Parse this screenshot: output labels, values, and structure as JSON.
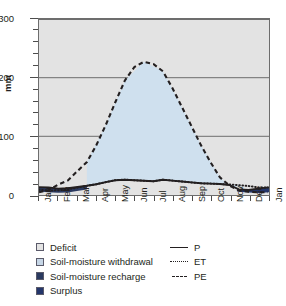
{
  "chart_data": {
    "type": "line",
    "title": "",
    "xlabel": "",
    "ylabel": "mm",
    "ylim": [
      0,
      300
    ],
    "yticks": [
      0,
      100,
      200,
      300
    ],
    "ytick_labels": [
      "0",
      "100",
      "200",
      "300"
    ],
    "y_minor_step": 20,
    "grid": "horizontal-gridlines-at-100-200-300",
    "legend_position": "below-plot",
    "categories": [
      "Jan",
      "Feb",
      "Mar",
      "Apr",
      "May",
      "Jun",
      "Jul",
      "Aug",
      "Sep",
      "Oct",
      "Nov",
      "Dec",
      "Jan"
    ],
    "series": [
      {
        "name": "P",
        "label": "P",
        "style": "solid",
        "color": "#231f20",
        "values": [
          16,
          14,
          15,
          20,
          26,
          22,
          24,
          26,
          23,
          20,
          18,
          17,
          16
        ]
      },
      {
        "name": "ET",
        "label": "ET",
        "style": "dotted",
        "color": "#231f20",
        "values": [
          16,
          14,
          15,
          20,
          26,
          22,
          20,
          17,
          16,
          15,
          14,
          14,
          16
        ]
      },
      {
        "name": "PE",
        "label": "PE",
        "style": "dashed",
        "color": "#231f20",
        "values": [
          5,
          8,
          18,
          55,
          120,
          195,
          228,
          210,
          150,
          85,
          30,
          8,
          5
        ]
      }
    ],
    "regions": [
      {
        "name": "Deficit",
        "color": "#e3e3e3",
        "description": "plot background / area above curves"
      },
      {
        "name": "Soil-moisture withdrawal",
        "color": "#cfe0ee",
        "description": "area between PE and P from Apr to Nov"
      },
      {
        "name": "Soil-moisture recharge",
        "color": "#2b3a60",
        "description": "narrow band between P and PE in Dec-Mar"
      },
      {
        "name": "Surplus",
        "color": "#24366b",
        "description": "narrow band Dec-Jan"
      }
    ]
  },
  "axes": {
    "y_label": "mm",
    "y_ticks": [
      "300",
      "200",
      "100",
      "0"
    ],
    "x_ticks": [
      "Jan",
      "Feb",
      "Mar",
      "Apr",
      "May",
      "Jun",
      "Jul",
      "Aug",
      "Sep",
      "Oct",
      "Nov",
      "Dec",
      "Jan"
    ]
  },
  "legend": {
    "swatches": [
      {
        "label": "Deficit",
        "color": "#e3e3e3"
      },
      {
        "label": "Soil-moisture withdrawal",
        "color": "#c6d6e6"
      },
      {
        "label": "Soil-moisture recharge",
        "color": "#2b3a60"
      },
      {
        "label": "Surplus",
        "color": "#24366b"
      }
    ],
    "lines": [
      {
        "label": "P",
        "style": "solid"
      },
      {
        "label": "ET",
        "style": "dotted"
      },
      {
        "label": "PE",
        "style": "dashed"
      }
    ]
  }
}
